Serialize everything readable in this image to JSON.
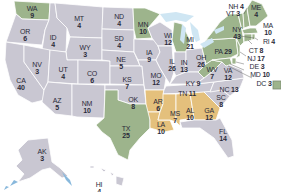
{
  "colors": {
    "gray": "#c9c7d2",
    "green": "#9db48c",
    "tan": "#e4c07c",
    "water": "#cfe6f3",
    "border": "#ffffff",
    "text": "#2b2b3a"
  },
  "states": [
    {
      "abbr": "WA",
      "votes": "9",
      "color": "green"
    },
    {
      "abbr": "OR",
      "votes": "6",
      "color": "gray"
    },
    {
      "abbr": "CA",
      "votes": "40",
      "color": "gray"
    },
    {
      "abbr": "ID",
      "votes": "4",
      "color": "gray"
    },
    {
      "abbr": "NV",
      "votes": "3",
      "color": "gray"
    },
    {
      "abbr": "MT",
      "votes": "4",
      "color": "gray"
    },
    {
      "abbr": "WY",
      "votes": "3",
      "color": "gray"
    },
    {
      "abbr": "UT",
      "votes": "4",
      "color": "gray"
    },
    {
      "abbr": "AZ",
      "votes": "5",
      "color": "gray"
    },
    {
      "abbr": "CO",
      "votes": "6",
      "color": "gray"
    },
    {
      "abbr": "NM",
      "votes": "10",
      "color": "gray"
    },
    {
      "abbr": "ND",
      "votes": "4",
      "color": "gray"
    },
    {
      "abbr": "SD",
      "votes": "4",
      "color": "gray"
    },
    {
      "abbr": "NE",
      "votes": "5",
      "color": "gray"
    },
    {
      "abbr": "KS",
      "votes": "7",
      "color": "gray"
    },
    {
      "abbr": "OK",
      "votes": "8",
      "color": "gray"
    },
    {
      "abbr": "TX",
      "votes": "25",
      "color": "green"
    },
    {
      "abbr": "MN",
      "votes": "10",
      "color": "green"
    },
    {
      "abbr": "IA",
      "votes": "9",
      "color": "gray"
    },
    {
      "abbr": "MO",
      "votes": "12",
      "color": "gray"
    },
    {
      "abbr": "AR",
      "votes": "6",
      "color": "tan"
    },
    {
      "abbr": "LA",
      "votes": "10",
      "color": "tan"
    },
    {
      "abbr": "WI",
      "votes": "12",
      "color": "gray"
    },
    {
      "abbr": "IL",
      "votes": "26",
      "color": "gray"
    },
    {
      "abbr": "MI",
      "votes": "21",
      "color": "green"
    },
    {
      "abbr": "IN",
      "votes": "13",
      "color": "gray"
    },
    {
      "abbr": "OH",
      "votes": "26",
      "color": "gray"
    },
    {
      "abbr": "KY",
      "votes": "9",
      "color": "gray"
    },
    {
      "abbr": "TN",
      "votes": "11",
      "color": "gray"
    },
    {
      "abbr": "MS",
      "votes": "7",
      "color": "tan"
    },
    {
      "abbr": "AL",
      "votes": "10",
      "color": "tan"
    },
    {
      "abbr": "GA",
      "votes": "12",
      "color": "tan"
    },
    {
      "abbr": "FL",
      "votes": "14",
      "color": "gray"
    },
    {
      "abbr": "SC",
      "votes": "8",
      "color": "gray"
    },
    {
      "abbr": "NC",
      "votes": "13",
      "color": "gray"
    },
    {
      "abbr": "VA",
      "votes": "12",
      "color": "gray"
    },
    {
      "abbr": "WV",
      "votes": "7",
      "color": "green"
    },
    {
      "abbr": "PA",
      "votes": "29",
      "color": "green"
    },
    {
      "abbr": "NY",
      "votes": "43",
      "color": "green"
    },
    {
      "abbr": "ME",
      "votes": "4",
      "color": "green"
    },
    {
      "abbr": "NH",
      "votes": "4",
      "color": "green"
    },
    {
      "abbr": "VT",
      "votes": "3",
      "color": "green"
    },
    {
      "abbr": "MA",
      "votes": "10",
      "color": "green"
    },
    {
      "abbr": "RI",
      "votes": "4",
      "color": "green"
    },
    {
      "abbr": "CT",
      "votes": "8",
      "color": "green"
    },
    {
      "abbr": "NJ",
      "votes": "17",
      "color": "green"
    },
    {
      "abbr": "DE",
      "votes": "3",
      "color": "green"
    },
    {
      "abbr": "MD",
      "votes": "10",
      "color": "green"
    },
    {
      "abbr": "DC",
      "votes": "3",
      "color": "green"
    },
    {
      "abbr": "AK",
      "votes": "3",
      "color": "gray"
    },
    {
      "abbr": "HI",
      "votes": "4",
      "color": "gray"
    }
  ]
}
